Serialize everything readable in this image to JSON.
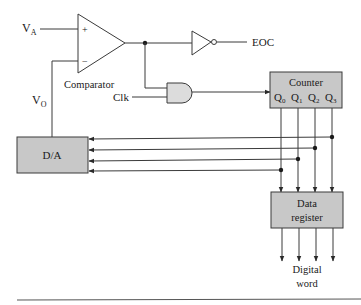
{
  "diagram": {
    "inputs": {
      "va_label": "V",
      "va_sub": "A",
      "vo_label": "V",
      "vo_sub": "O",
      "clk_label": "Clk"
    },
    "comparator": {
      "label": "Comparator",
      "plus": "+",
      "minus": "−"
    },
    "eoc_label": "EOC",
    "counter": {
      "title": "Counter",
      "outputs": [
        {
          "q": "Q",
          "sub": "0"
        },
        {
          "q": "Q",
          "sub": "1"
        },
        {
          "q": "Q",
          "sub": "2"
        },
        {
          "q": "Q",
          "sub": "3"
        }
      ]
    },
    "dac": {
      "label": "D/A"
    },
    "data_register": {
      "line1": "Data",
      "line2": "register"
    },
    "output": {
      "line1": "Digital",
      "line2": "word"
    },
    "colors": {
      "block_fill": "#c8c8c8",
      "gate_fill": "#dcdcdc",
      "stroke": "#3a3a3a"
    }
  }
}
